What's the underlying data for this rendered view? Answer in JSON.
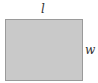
{
  "diagram": {
    "shape": "rectangle",
    "fill_color": "#c9c9c9",
    "border_color": "#9a9a9a",
    "labels": {
      "length": "l",
      "width": "w"
    }
  }
}
